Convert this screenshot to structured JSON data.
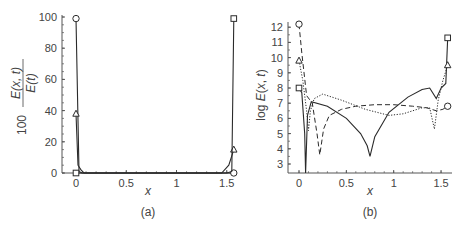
{
  "chart_data": [
    {
      "type": "line",
      "panel_label": "(a)",
      "xlabel": "x",
      "ylabel": "100 E(x, t) / E(t)",
      "ylabel_parts": {
        "factor": "100",
        "numerator": "E(x, t)",
        "denominator": "E(t)"
      },
      "xlim": [
        -0.05,
        1.6
      ],
      "ylim": [
        0,
        100
      ],
      "xticks": [
        "0",
        "0.5",
        "1",
        "1.5"
      ],
      "yticks": [
        "0",
        "20",
        "40",
        "60",
        "80",
        "100"
      ],
      "grid": false,
      "series": [
        {
          "name": "circle-marker",
          "marker": "circle",
          "style": "solid",
          "x": [
            0,
            0.03,
            0.06,
            1.5,
            1.55,
            1.57
          ],
          "y": [
            99,
            1,
            0,
            0,
            0,
            0
          ]
        },
        {
          "name": "triangle-marker",
          "marker": "triangle",
          "style": "solid",
          "x": [
            0,
            0.02,
            0.05,
            0.08,
            1.45,
            1.52,
            1.57
          ],
          "y": [
            38,
            5,
            2,
            0,
            0,
            5,
            15
          ]
        },
        {
          "name": "square-marker",
          "marker": "square",
          "style": "solid",
          "x": [
            0,
            0.05,
            1.5,
            1.55,
            1.57
          ],
          "y": [
            0,
            0,
            0,
            1,
            99
          ]
        }
      ]
    },
    {
      "type": "line",
      "panel_label": "(b)",
      "xlabel": "x",
      "ylabel": "log E(x, t)",
      "xlim": [
        -0.05,
        1.6
      ],
      "ylim": [
        2.5,
        12.5
      ],
      "xticks": [
        "0",
        "0.5",
        "1",
        "1.5"
      ],
      "yticks": [
        "3",
        "4",
        "5",
        "6",
        "7",
        "8",
        "9",
        "10",
        "11",
        "12"
      ],
      "grid": false,
      "series": [
        {
          "name": "solid-square",
          "marker": "square",
          "style": "solid",
          "x": [
            0,
            0.03,
            0.06,
            0.07,
            0.09,
            0.13,
            0.3,
            0.5,
            0.65,
            0.72,
            0.75,
            0.8,
            0.95,
            1.15,
            1.3,
            1.38,
            1.45,
            1.5,
            1.55,
            1.57
          ],
          "y": [
            8,
            7.7,
            5,
            2.3,
            6.2,
            7.1,
            6.8,
            6.0,
            5.0,
            4.2,
            3.5,
            4.8,
            6.4,
            7.4,
            7.9,
            8.0,
            7.3,
            8.0,
            8.3,
            11.3
          ]
        },
        {
          "name": "dashdot-triangle",
          "marker": "triangle",
          "style": "dashdot",
          "x": [
            0,
            0.04,
            0.08,
            0.1,
            0.12,
            0.16,
            0.25,
            0.45,
            0.7,
            0.95,
            1.1,
            1.3,
            1.38,
            1.43,
            1.47,
            1.52,
            1.57
          ],
          "y": [
            9.8,
            8.5,
            6.5,
            5.2,
            6.5,
            7.3,
            7.6,
            7.2,
            6.6,
            6.2,
            6.3,
            6.7,
            6.7,
            5.3,
            7.2,
            8.5,
            9.5
          ]
        },
        {
          "name": "dashed-circle",
          "marker": "circle",
          "style": "dashed",
          "x": [
            0,
            0.03,
            0.08,
            0.14,
            0.19,
            0.22,
            0.26,
            0.32,
            0.45,
            0.6,
            0.8,
            1.0,
            1.2,
            1.35,
            1.45,
            1.52,
            1.57
          ],
          "y": [
            12.2,
            10.3,
            7.5,
            7.0,
            5.0,
            3.6,
            5.3,
            6.2,
            6.6,
            6.8,
            6.9,
            6.9,
            6.8,
            6.7,
            6.5,
            6.6,
            6.8
          ]
        }
      ]
    }
  ],
  "panels": {
    "a": {
      "label": "(a)",
      "xlabel": "x",
      "ylabel_factor": "100",
      "ylabel_num": "E(x, t)",
      "ylabel_den": "E(t)"
    },
    "b": {
      "label": "(b)",
      "xlabel": "x",
      "ylabel": "log E(x, t)"
    }
  },
  "colors": {
    "line": "#2a2a2a",
    "axis": "#555555",
    "text": "#444444"
  }
}
